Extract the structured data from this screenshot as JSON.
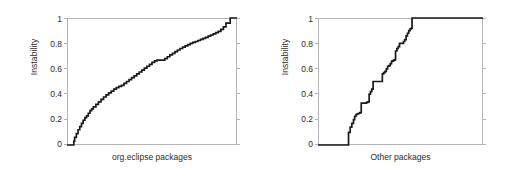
{
  "figure": {
    "background": "#ffffff",
    "curve_color": "#1a1a1a",
    "frame_color": "#b4b4b4",
    "text_color": "#2b2b2b"
  },
  "chart_data": [
    {
      "type": "line",
      "title": "",
      "xlabel": "org.eclipse packages",
      "ylabel": "Instability",
      "xlim": [
        0,
        1
      ],
      "ylim": [
        0,
        1
      ],
      "grid": false,
      "legend": null,
      "ytick_labels": [
        "1",
        "0.8",
        "0.6",
        "0.4",
        "0.2",
        "0"
      ],
      "ytick_values": [
        1,
        0.8,
        0.6,
        0.4,
        0.2,
        0
      ],
      "xtick_labels": [],
      "series": [
        {
          "name": "org.eclipse instability CDF",
          "x": [
            0.0,
            0.02,
            0.035,
            0.04,
            0.045,
            0.055,
            0.065,
            0.075,
            0.085,
            0.095,
            0.105,
            0.115,
            0.125,
            0.135,
            0.145,
            0.155,
            0.17,
            0.185,
            0.2,
            0.215,
            0.23,
            0.245,
            0.26,
            0.275,
            0.29,
            0.305,
            0.32,
            0.335,
            0.35,
            0.365,
            0.38,
            0.395,
            0.41,
            0.425,
            0.44,
            0.455,
            0.47,
            0.485,
            0.5,
            0.515,
            0.53,
            0.545,
            0.56,
            0.575,
            0.59,
            0.605,
            0.62,
            0.635,
            0.65,
            0.665,
            0.68,
            0.695,
            0.71,
            0.725,
            0.74,
            0.755,
            0.77,
            0.785,
            0.8,
            0.815,
            0.83,
            0.845,
            0.86,
            0.875,
            0.89,
            0.905,
            0.92,
            0.935,
            0.96,
            1.0
          ],
          "y": [
            0.0,
            0.0,
            0.0,
            0.03,
            0.06,
            0.09,
            0.12,
            0.145,
            0.17,
            0.195,
            0.215,
            0.23,
            0.25,
            0.27,
            0.285,
            0.3,
            0.32,
            0.34,
            0.36,
            0.378,
            0.395,
            0.41,
            0.425,
            0.44,
            0.452,
            0.462,
            0.47,
            0.485,
            0.5,
            0.515,
            0.53,
            0.545,
            0.56,
            0.575,
            0.59,
            0.605,
            0.62,
            0.635,
            0.65,
            0.662,
            0.668,
            0.668,
            0.668,
            0.68,
            0.695,
            0.71,
            0.722,
            0.735,
            0.748,
            0.76,
            0.77,
            0.78,
            0.79,
            0.8,
            0.808,
            0.815,
            0.823,
            0.832,
            0.84,
            0.848,
            0.857,
            0.866,
            0.875,
            0.885,
            0.895,
            0.91,
            0.93,
            0.96,
            1.0,
            1.0
          ]
        }
      ]
    },
    {
      "type": "line",
      "title": "",
      "xlabel": "Other packages",
      "ylabel": "Instability",
      "xlim": [
        0,
        1
      ],
      "ylim": [
        0,
        1
      ],
      "grid": false,
      "legend": null,
      "ytick_labels": [
        "1",
        "0.8",
        "0.6",
        "0.4",
        "0.2",
        "0"
      ],
      "ytick_values": [
        1,
        0.8,
        0.6,
        0.4,
        0.2,
        0
      ],
      "xtick_labels": [],
      "series": [
        {
          "name": "Other packages instability CDF",
          "x": [
            0.0,
            0.175,
            0.185,
            0.195,
            0.205,
            0.215,
            0.222,
            0.23,
            0.238,
            0.246,
            0.254,
            0.262,
            0.27,
            0.278,
            0.286,
            0.294,
            0.302,
            0.31,
            0.318,
            0.326,
            0.334,
            0.342,
            0.35,
            0.358,
            0.366,
            0.374,
            0.382,
            0.39,
            0.398,
            0.406,
            0.414,
            0.422,
            0.43,
            0.438,
            0.446,
            0.454,
            0.462,
            0.47,
            0.478,
            0.486,
            0.494,
            0.502,
            0.51,
            0.518,
            0.526,
            0.534,
            0.542,
            0.55,
            0.558,
            0.566,
            0.57,
            1.0
          ],
          "y": [
            0.0,
            0.0,
            0.1,
            0.14,
            0.17,
            0.2,
            0.225,
            0.24,
            0.245,
            0.25,
            0.255,
            0.33,
            0.33,
            0.33,
            0.33,
            0.335,
            0.34,
            0.4,
            0.42,
            0.44,
            0.5,
            0.5,
            0.5,
            0.5,
            0.5,
            0.5,
            0.5,
            0.56,
            0.57,
            0.58,
            0.6,
            0.62,
            0.625,
            0.64,
            0.66,
            0.665,
            0.67,
            0.74,
            0.76,
            0.775,
            0.8,
            0.8,
            0.8,
            0.815,
            0.83,
            0.86,
            0.88,
            0.9,
            0.915,
            0.92,
            1.0,
            1.0
          ]
        }
      ]
    }
  ]
}
